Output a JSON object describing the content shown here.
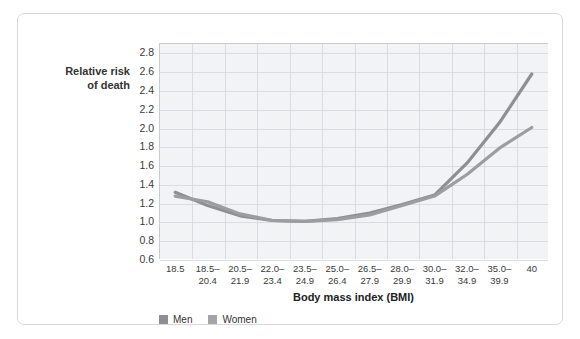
{
  "chart_data": {
    "type": "line",
    "title": "",
    "xlabel": "Body mass index (BMI)",
    "ylabel": "Relative risk\nof death",
    "ylabel_line1": "Relative risk",
    "ylabel_line2": "of death",
    "categories": [
      "18.5",
      "18.5–20.4",
      "20.5–21.9",
      "22.0–23.4",
      "23.5–24.9",
      "25.0–26.4",
      "26.5–27.9",
      "28.0–29.9",
      "30.0–31.9",
      "32.0–34.9",
      "35.0–39.9",
      "40"
    ],
    "category_lines": [
      [
        "18.5",
        ""
      ],
      [
        "18.5–",
        "20.4"
      ],
      [
        "20.5–",
        "21.9"
      ],
      [
        "22.0–",
        "23.4"
      ],
      [
        "23.5–",
        "24.9"
      ],
      [
        "25.0–",
        "26.4"
      ],
      [
        "26.5–",
        "27.9"
      ],
      [
        "28.0–",
        "29.9"
      ],
      [
        "30.0–",
        "31.9"
      ],
      [
        "32.0–",
        "34.9"
      ],
      [
        "35.0–",
        "39.9"
      ],
      [
        "40",
        ""
      ]
    ],
    "ylim": [
      0.6,
      2.9
    ],
    "yticks": [
      "0.6",
      "0.8",
      "1.0",
      "1.2",
      "1.4",
      "1.6",
      "1.8",
      "2.0",
      "2.2",
      "2.4",
      "2.6",
      "2.8"
    ],
    "ytick_values": [
      0.6,
      0.8,
      1.0,
      1.2,
      1.4,
      1.6,
      1.8,
      2.0,
      2.2,
      2.4,
      2.6,
      2.8
    ],
    "grid": true,
    "legend_position": "bottom-left",
    "series": [
      {
        "name": "Men",
        "color": "#8d8f92",
        "values": [
          1.31,
          1.17,
          1.06,
          1.01,
          1.0,
          1.03,
          1.09,
          1.18,
          1.28,
          1.62,
          2.05,
          2.57
        ]
      },
      {
        "name": "Women",
        "color": "#9b9da0",
        "values": [
          1.27,
          1.21,
          1.08,
          1.01,
          1.0,
          1.02,
          1.07,
          1.17,
          1.27,
          1.5,
          1.78,
          2.0
        ]
      }
    ]
  },
  "legend": {
    "items": [
      {
        "label": "Men",
        "color": "#8d8f92"
      },
      {
        "label": "Women",
        "color": "#a3a5a8"
      }
    ]
  },
  "axes": {
    "x_title": "Body mass index (BMI)",
    "y_title_line1": "Relative risk",
    "y_title_line2": "of death"
  },
  "colors": {
    "plot_background": "#f2f3f5",
    "gridline": "#d9dce0",
    "axis": "#c9ccd1",
    "card_border": "#d8d8d8",
    "text": "#333333"
  }
}
